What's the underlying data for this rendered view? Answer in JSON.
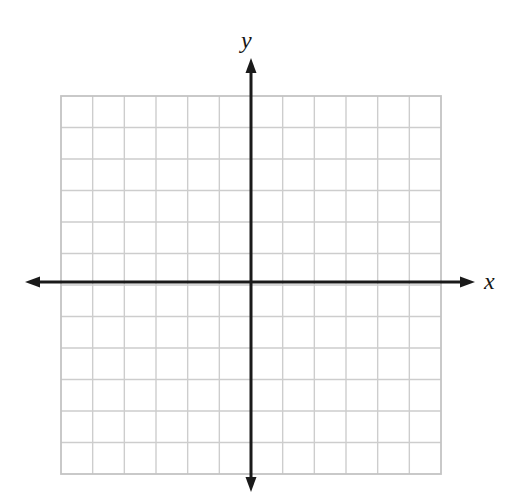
{
  "figure": {
    "kind": "blank-cartesian-coordinate-grid",
    "background_color": "#ffffff",
    "width": 527,
    "height": 500
  },
  "axis_labels": {
    "x": "x",
    "y": "y"
  },
  "chart_data": {
    "type": "scatter",
    "title": "",
    "subtitle": "",
    "xlabel": "x",
    "ylabel": "y",
    "series": [
      {
        "name": "",
        "x": [],
        "y": [],
        "values": []
      }
    ],
    "x": [],
    "values": [],
    "categories": [],
    "annotations": [],
    "legend": {
      "entries": [],
      "position": "none",
      "visible": false
    },
    "xlim": [
      -6,
      6
    ],
    "ylim": [
      -6,
      6
    ],
    "xticks": [
      -6,
      -5,
      -4,
      -3,
      -2,
      -1,
      0,
      1,
      2,
      3,
      4,
      5,
      6
    ],
    "yticks": [
      -6,
      -5,
      -4,
      -3,
      -2,
      -1,
      0,
      1,
      2,
      3,
      4,
      5,
      6
    ],
    "xtick_labels": [],
    "ytick_labels": [],
    "grid": true,
    "grid_columns": 12,
    "grid_rows": 12,
    "grid_step": 1
  },
  "geometry": {
    "grid_left": 61,
    "grid_right": 441,
    "grid_top": 96,
    "grid_bottom": 474,
    "origin_x": 251,
    "origin_y": 282,
    "cell_width": 31.667,
    "cell_height": 31.5,
    "x_axis_y": 282,
    "y_axis_x": 251,
    "x_axis_start": 25,
    "x_axis_end": 475,
    "y_axis_start": 58,
    "y_axis_end": 492
  },
  "style": {
    "grid_line_color": "#cdcdcd",
    "grid_line_width": 1.4,
    "grid_border_color": "#c4c4c4",
    "grid_border_width": 1.8,
    "axis_color": "#1a1a1a",
    "axis_line_width": 3,
    "arrow_length": 15,
    "arrow_half_width": 5.5,
    "label_color": "#151515"
  }
}
